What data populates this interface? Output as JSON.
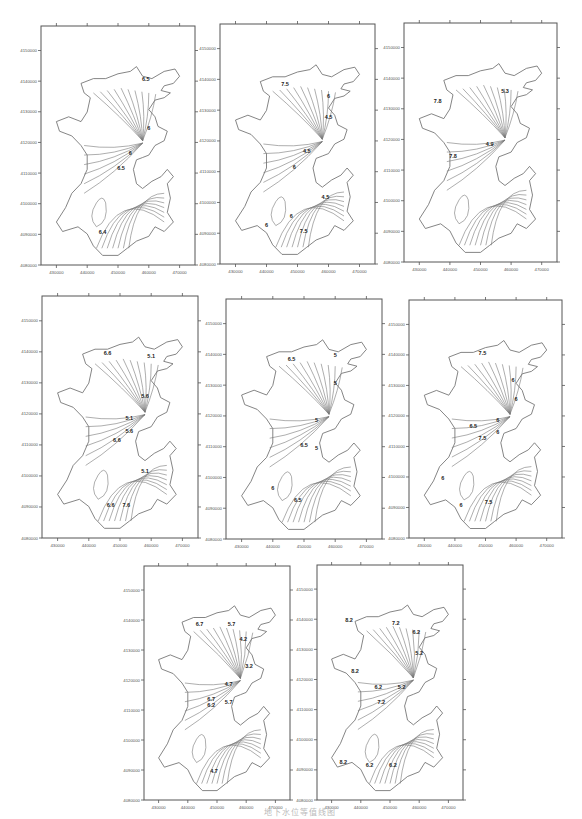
{
  "figure": {
    "caption": "地下水位等值线图",
    "panel_count": 8
  },
  "chart_data": [
    {
      "type": "contour",
      "panel": 1,
      "xlabel": "",
      "ylabel": "",
      "x_ticks": [
        "430000",
        "440000",
        "450000",
        "460000",
        "470000"
      ],
      "y_ticks": [
        "4080000",
        "4090000",
        "4100000",
        "4110000",
        "4120000",
        "4130000",
        "4140000",
        "4150000"
      ],
      "xlim": [
        425000,
        475000
      ],
      "ylim": [
        4080000,
        4158000
      ],
      "contour_labels": [
        {
          "text": "6.5",
          "x": 459000,
          "y": 4140000
        },
        {
          "text": "6",
          "x": 460000,
          "y": 4124000
        },
        {
          "text": "6",
          "x": 454000,
          "y": 4116000
        },
        {
          "text": "6.5",
          "x": 451000,
          "y": 4111000
        },
        {
          "text": "6.4",
          "x": 445000,
          "y": 4090000
        }
      ]
    },
    {
      "type": "contour",
      "panel": 2,
      "xlabel": "",
      "ylabel": "",
      "x_ticks": [
        "430000",
        "440000",
        "450000",
        "460000",
        "470000"
      ],
      "y_ticks": [
        "4080000",
        "4090000",
        "4100000",
        "4110000",
        "4120000",
        "4130000",
        "4140000",
        "4150000"
      ],
      "xlim": [
        425000,
        475000
      ],
      "ylim": [
        4080000,
        4158000
      ],
      "contour_labels": [
        {
          "text": "7.5",
          "x": 446000,
          "y": 4138000
        },
        {
          "text": "6",
          "x": 460000,
          "y": 4134000
        },
        {
          "text": "4.5",
          "x": 460000,
          "y": 4127000
        },
        {
          "text": "4.5",
          "x": 453000,
          "y": 4116000
        },
        {
          "text": "6",
          "x": 449000,
          "y": 4111000
        },
        {
          "text": "4.5",
          "x": 459000,
          "y": 4101000
        },
        {
          "text": "6",
          "x": 448000,
          "y": 4095000
        },
        {
          "text": "6",
          "x": 440000,
          "y": 4092000
        },
        {
          "text": "7.5",
          "x": 452000,
          "y": 4090000
        }
      ]
    },
    {
      "type": "contour",
      "panel": 3,
      "xlabel": "",
      "ylabel": "",
      "x_ticks": [
        "430000",
        "440000",
        "450000",
        "460000",
        "470000"
      ],
      "y_ticks": [
        "4080000",
        "4090000",
        "4100000",
        "4110000",
        "4120000",
        "4130000",
        "4140000",
        "4150000"
      ],
      "xlim": [
        425000,
        475000
      ],
      "ylim": [
        4080000,
        4158000
      ],
      "contour_labels": [
        {
          "text": "7.8",
          "x": 436000,
          "y": 4132000
        },
        {
          "text": "5.3",
          "x": 458000,
          "y": 4135000
        },
        {
          "text": "4.9",
          "x": 453000,
          "y": 4118000
        },
        {
          "text": "7.8",
          "x": 441000,
          "y": 4114000
        }
      ]
    },
    {
      "type": "contour",
      "panel": 4,
      "xlabel": "",
      "ylabel": "",
      "x_ticks": [
        "430000",
        "440000",
        "450000",
        "460000",
        "470000"
      ],
      "y_ticks": [
        "4080000",
        "4090000",
        "4100000",
        "4110000",
        "4120000",
        "4130000",
        "4140000",
        "4150000"
      ],
      "xlim": [
        425000,
        475000
      ],
      "ylim": [
        4080000,
        4158000
      ],
      "contour_labels": [
        {
          "text": "6.6",
          "x": 446000,
          "y": 4139000
        },
        {
          "text": "5.1",
          "x": 460000,
          "y": 4138000
        },
        {
          "text": "5.6",
          "x": 458000,
          "y": 4125000
        },
        {
          "text": "5.1",
          "x": 453000,
          "y": 4118000
        },
        {
          "text": "5.6",
          "x": 453000,
          "y": 4114000
        },
        {
          "text": "6.6",
          "x": 449000,
          "y": 4111000
        },
        {
          "text": "5.1",
          "x": 458000,
          "y": 4101000
        },
        {
          "text": "6.6",
          "x": 447000,
          "y": 4090000
        },
        {
          "text": "7.6",
          "x": 452000,
          "y": 4090000
        }
      ]
    },
    {
      "type": "contour",
      "panel": 5,
      "xlabel": "",
      "ylabel": "",
      "x_ticks": [
        "430000",
        "440000",
        "450000",
        "460000",
        "470000"
      ],
      "y_ticks": [
        "4080000",
        "4090000",
        "4100000",
        "4110000",
        "4120000",
        "4130000",
        "4140000",
        "4150000"
      ],
      "xlim": [
        425000,
        475000
      ],
      "ylim": [
        4080000,
        4158000
      ],
      "contour_labels": [
        {
          "text": "6.5",
          "x": 446000,
          "y": 4138000
        },
        {
          "text": "5",
          "x": 460000,
          "y": 4139000
        },
        {
          "text": "5",
          "x": 460000,
          "y": 4130000
        },
        {
          "text": "5",
          "x": 454000,
          "y": 4118000
        },
        {
          "text": "6.5",
          "x": 450000,
          "y": 4110000
        },
        {
          "text": "5",
          "x": 454000,
          "y": 4109000
        },
        {
          "text": "6",
          "x": 440000,
          "y": 4096000
        },
        {
          "text": "6.5",
          "x": 448000,
          "y": 4092000
        }
      ]
    },
    {
      "type": "contour",
      "panel": 6,
      "xlabel": "",
      "ylabel": "",
      "x_ticks": [
        "430000",
        "440000",
        "450000",
        "460000",
        "470000"
      ],
      "y_ticks": [
        "4080000",
        "4090000",
        "4100000",
        "4110000",
        "4120000",
        "4130000",
        "4140000",
        "4150000"
      ],
      "xlim": [
        425000,
        475000
      ],
      "ylim": [
        4080000,
        4158000
      ],
      "contour_labels": [
        {
          "text": "7.5",
          "x": 449000,
          "y": 4140000
        },
        {
          "text": "6",
          "x": 459000,
          "y": 4131000
        },
        {
          "text": "6",
          "x": 460000,
          "y": 4125000
        },
        {
          "text": "6",
          "x": 454000,
          "y": 4118000
        },
        {
          "text": "6.5",
          "x": 446000,
          "y": 4116000
        },
        {
          "text": "6",
          "x": 454000,
          "y": 4114000
        },
        {
          "text": "7.5",
          "x": 449000,
          "y": 4112000
        },
        {
          "text": "6",
          "x": 436000,
          "y": 4099000
        },
        {
          "text": "6",
          "x": 442000,
          "y": 4090000
        },
        {
          "text": "7.5",
          "x": 451000,
          "y": 4091000
        }
      ]
    },
    {
      "type": "contour",
      "panel": 7,
      "xlabel": "",
      "ylabel": "",
      "x_ticks": [
        "430000",
        "440000",
        "450000",
        "460000",
        "470000"
      ],
      "y_ticks": [
        "4080000",
        "4090000",
        "4100000",
        "4110000",
        "4120000",
        "4130000",
        "4140000",
        "4150000"
      ],
      "xlim": [
        425000,
        475000
      ],
      "ylim": [
        4080000,
        4158000
      ],
      "contour_labels": [
        {
          "text": "6.7",
          "x": 444000,
          "y": 4138000
        },
        {
          "text": "5.7",
          "x": 455000,
          "y": 4138000
        },
        {
          "text": "4.2",
          "x": 459000,
          "y": 4133000
        },
        {
          "text": "3.2",
          "x": 461000,
          "y": 4124000
        },
        {
          "text": "4.7",
          "x": 454000,
          "y": 4118000
        },
        {
          "text": "6.7",
          "x": 448000,
          "y": 4113000
        },
        {
          "text": "5.7",
          "x": 454000,
          "y": 4112000
        },
        {
          "text": "6.2",
          "x": 448000,
          "y": 4111000
        },
        {
          "text": "4.7",
          "x": 449000,
          "y": 4089000
        }
      ]
    },
    {
      "type": "contour",
      "panel": 8,
      "xlabel": "",
      "ylabel": "",
      "x_ticks": [
        "430000",
        "440000",
        "450000",
        "460000",
        "470000"
      ],
      "y_ticks": [
        "4080000",
        "4090000",
        "4100000",
        "4110000",
        "4120000",
        "4130000",
        "4140000",
        "4150000"
      ],
      "xlim": [
        425000,
        475000
      ],
      "ylim": [
        4080000,
        4158000
      ],
      "contour_labels": [
        {
          "text": "8.2",
          "x": 436000,
          "y": 4139000
        },
        {
          "text": "7.2",
          "x": 452000,
          "y": 4138000
        },
        {
          "text": "6.2",
          "x": 459000,
          "y": 4135000
        },
        {
          "text": "5.2",
          "x": 460000,
          "y": 4128000
        },
        {
          "text": "8.2",
          "x": 438000,
          "y": 4122000
        },
        {
          "text": "6.2",
          "x": 446000,
          "y": 4117000
        },
        {
          "text": "5.2",
          "x": 454000,
          "y": 4117000
        },
        {
          "text": "7.2",
          "x": 447000,
          "y": 4112000
        },
        {
          "text": "8.2",
          "x": 434000,
          "y": 4092000
        },
        {
          "text": "6.2",
          "x": 443000,
          "y": 4091000
        },
        {
          "text": "6.2",
          "x": 451000,
          "y": 4091000
        }
      ]
    }
  ]
}
